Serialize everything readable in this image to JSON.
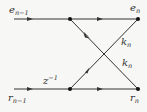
{
  "diagram": {
    "type": "lattice-filter-stage",
    "colors": {
      "line": "#333333",
      "background": "#f7f7f5"
    },
    "labels": {
      "input_top": {
        "base": "e",
        "sub": "n−1"
      },
      "output_top": {
        "base": "e",
        "sub": "n"
      },
      "input_bottom": {
        "base": "r",
        "sub": "n−1"
      },
      "output_bottom": {
        "base": "r",
        "sub": "n"
      },
      "delay": {
        "base": "z",
        "sup": "−1"
      },
      "coef_upper": {
        "base": "k",
        "sub": "n"
      },
      "coef_lower": {
        "base": "k",
        "sub": "n"
      }
    },
    "edges": [
      {
        "from": "e_{n-1}",
        "to": "node-top-left",
        "label": ""
      },
      {
        "from": "node-top-left",
        "to": "e_n",
        "label": ""
      },
      {
        "from": "node-top-left",
        "to": "r_n",
        "label": "k_n"
      },
      {
        "from": "r_{n-1}",
        "to": "node-bottom-left",
        "label": "z^{-1}"
      },
      {
        "from": "node-bottom-left",
        "to": "r_n",
        "label": ""
      },
      {
        "from": "node-bottom-left",
        "to": "e_n",
        "label": "k_n"
      }
    ]
  }
}
